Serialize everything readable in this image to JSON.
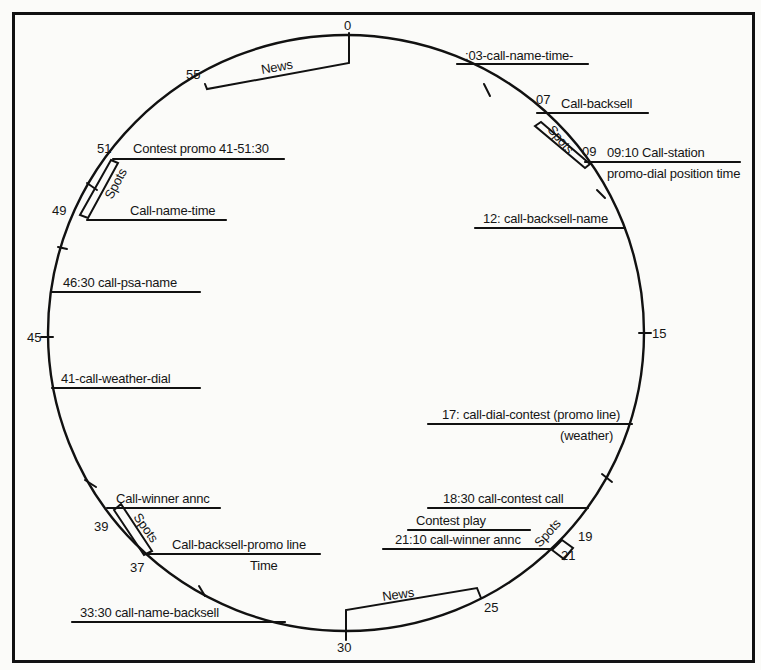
{
  "diagram": {
    "type": "broadcast-hour-clock",
    "minute_markers": [
      {
        "label": "0",
        "minute": 0
      },
      {
        "label": "07",
        "minute": 7
      },
      {
        "label": "09",
        "minute": 9
      },
      {
        "label": "15",
        "minute": 15
      },
      {
        "label": "19",
        "minute": 19
      },
      {
        "label": "21",
        "minute": 21
      },
      {
        "label": "25",
        "minute": 25
      },
      {
        "label": "30",
        "minute": 30
      },
      {
        "label": "37",
        "minute": 37
      },
      {
        "label": "39",
        "minute": 39
      },
      {
        "label": "45",
        "minute": 45
      },
      {
        "label": "49",
        "minute": 49
      },
      {
        "label": "51",
        "minute": 51
      },
      {
        "label": "55",
        "minute": 55
      }
    ],
    "blocks": [
      {
        "label": "News",
        "from": "55",
        "to": "0"
      },
      {
        "label": "Spots",
        "from": "07",
        "to": "09"
      },
      {
        "label": "Spots",
        "from": "19",
        "to": "21"
      },
      {
        "label": "News",
        "from": "25",
        "to": "30"
      },
      {
        "label": "Spots",
        "from": "37",
        "to": "39"
      },
      {
        "label": "Spots",
        "from": "49",
        "to": "51"
      }
    ],
    "annotations": {
      "a03": ":03-call-name-time-",
      "a07": "Call-backsell",
      "a09_line1": "09:10 Call-station",
      "a09_line2": "promo-dial position time",
      "a12": "12: call-backsell-name",
      "a17_line1": "17: call-dial-contest (promo line)",
      "a17_line2": "(weather)",
      "a1830": "18:30 call-contest call",
      "a_contest_play": "Contest play",
      "a2110": "21:10 call-winner annc",
      "a3330": "33:30 call-name-backsell",
      "a37_line1": "Call-backsell-promo line",
      "a37_line2": "Time",
      "a39": "Call-winner annc",
      "a41": "41-call-weather-dial",
      "a4630": "46:30 call-psa-name",
      "a49": "Call-name-time",
      "a51": "Contest promo 41-51:30"
    }
  }
}
